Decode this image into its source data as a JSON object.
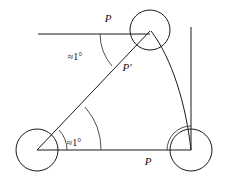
{
  "figure": {
    "background_color": "#ffffff",
    "stroke_color": "#1a1a1a",
    "width": 226,
    "height": 185,
    "labels": {
      "point_p_top": "P",
      "point_p_prime": "P′",
      "point_p_bottom": "P",
      "angle_top": "≈1°",
      "angle_bottom_left": "≈1°"
    },
    "circles": [
      {
        "name": "top-circle",
        "cx": 150,
        "cy": 30,
        "r": 20
      },
      {
        "name": "bottom-left-circle",
        "cx": 37,
        "cy": 150,
        "r": 21
      },
      {
        "name": "bottom-right-circle",
        "cx": 191,
        "cy": 150,
        "r": 21
      }
    ],
    "segments": [
      {
        "name": "horizontal-top-line",
        "x1": 38,
        "y1": 34,
        "x2": 150,
        "y2": 34
      },
      {
        "name": "diagonal-line",
        "x1": 37,
        "y1": 150,
        "x2": 150,
        "y2": 31
      },
      {
        "name": "horizontal-bottom-line",
        "x1": 37,
        "y1": 150,
        "x2": 191,
        "y2": 150
      },
      {
        "name": "vertical-right-line",
        "x1": 191,
        "y1": 27,
        "x2": 191,
        "y2": 150
      }
    ],
    "arcs": [
      {
        "name": "long-curved-arc",
        "from": [
          150,
          31
        ],
        "to": [
          191,
          150
        ]
      },
      {
        "name": "angle-arc-top",
        "vertex": [
          150,
          33
        ]
      },
      {
        "name": "angle-arc-bottom-left-inner",
        "vertex": [
          37,
          150
        ]
      },
      {
        "name": "angle-arc-bottom-left-outer",
        "vertex": [
          37,
          150
        ]
      },
      {
        "name": "angle-arc-bottom-right",
        "vertex": [
          191,
          150
        ]
      }
    ],
    "label_positions": {
      "point_p_top": {
        "x": 108,
        "y": 22
      },
      "point_p_prime": {
        "x": 127,
        "y": 71
      },
      "point_p_bottom": {
        "x": 148,
        "y": 164
      },
      "angle_top": {
        "x": 75,
        "y": 59
      },
      "angle_bottom_left": {
        "x": 72,
        "y": 145
      }
    }
  }
}
